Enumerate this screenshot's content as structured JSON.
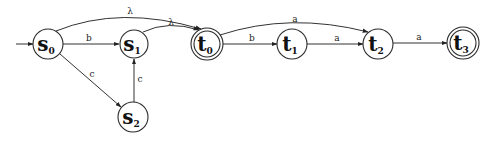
{
  "diagram": {
    "type": "finite-automaton",
    "start_state": "s0",
    "nodes": [
      {
        "id": "s0",
        "base": "s",
        "sub": "0",
        "x": 48,
        "y": 44,
        "r": 15,
        "accepting": false
      },
      {
        "id": "s1",
        "base": "s",
        "sub": "1",
        "x": 134,
        "y": 44,
        "r": 14,
        "accepting": false
      },
      {
        "id": "s2",
        "base": "s",
        "sub": "2",
        "x": 133,
        "y": 117,
        "r": 15,
        "accepting": false
      },
      {
        "id": "t0",
        "base": "t",
        "sub": "0",
        "x": 207,
        "y": 44,
        "r": 16,
        "accepting": true
      },
      {
        "id": "t1",
        "base": "t",
        "sub": "1",
        "x": 292,
        "y": 44,
        "r": 15,
        "accepting": false
      },
      {
        "id": "t2",
        "base": "t",
        "sub": "2",
        "x": 378,
        "y": 44,
        "r": 15,
        "accepting": false
      },
      {
        "id": "t3",
        "base": "t",
        "sub": "3",
        "x": 463,
        "y": 43,
        "r": 16,
        "accepting": true
      }
    ],
    "edges": [
      {
        "from": "s0",
        "to": "s1",
        "label": "b"
      },
      {
        "from": "s0",
        "to": "s2",
        "label": "c"
      },
      {
        "from": "s2",
        "to": "s1",
        "label": "c"
      },
      {
        "from": "s0",
        "to": "t0",
        "label": "λ",
        "curved": true
      },
      {
        "from": "s1",
        "to": "t0",
        "label": "λ",
        "curved": true
      },
      {
        "from": "t0",
        "to": "t1",
        "label": "b"
      },
      {
        "from": "t0",
        "to": "t2",
        "label": "a",
        "curved": true
      },
      {
        "from": "t1",
        "to": "t2",
        "label": "a"
      },
      {
        "from": "t2",
        "to": "t3",
        "label": "a"
      }
    ]
  },
  "labels": {
    "s0": {
      "base": "s",
      "sub": "0"
    },
    "s1": {
      "base": "s",
      "sub": "1"
    },
    "s2": {
      "base": "s",
      "sub": "2"
    },
    "t0": {
      "base": "t",
      "sub": "0"
    },
    "t1": {
      "base": "t",
      "sub": "1"
    },
    "t2": {
      "base": "t",
      "sub": "2"
    },
    "t3": {
      "base": "t",
      "sub": "3"
    },
    "e_s0_s1": "b",
    "e_s0_s2": "c",
    "e_s2_s1": "c",
    "e_s0_t0": "λ",
    "e_s1_t0": "λ",
    "e_t0_t1": "b",
    "e_t0_t2": "a",
    "e_t1_t2": "a",
    "e_t2_t3": "a"
  }
}
